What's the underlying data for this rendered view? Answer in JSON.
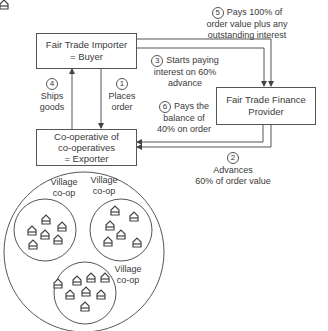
{
  "diagram": {
    "nodes": {
      "importer": {
        "line1": "Fair Trade Importer",
        "line2": "= Buyer"
      },
      "finance": {
        "line1": "Fair Trade Finance",
        "line2": "Provider"
      },
      "coop": {
        "line1": "Co-operative of",
        "line2": "co-operatives",
        "line3": "= Exporter"
      }
    },
    "steps": [
      {
        "num": "1",
        "line1": "Places",
        "line2": "order"
      },
      {
        "num": "2",
        "line1": "Advances",
        "line2": "60% of order value"
      },
      {
        "num": "3",
        "line1": "Starts paying",
        "line2": "interest on 60%",
        "line3": "advance"
      },
      {
        "num": "4",
        "line1": "Ships",
        "line2": "goods"
      },
      {
        "num": "5",
        "line1": "Pays 100% of",
        "line2": "order value plus any",
        "line3": "outstanding interest"
      },
      {
        "num": "6",
        "line1": "Pays the",
        "line2": "balance of",
        "line3": "40% on order"
      }
    ],
    "villages": [
      {
        "line1": "Village",
        "line2": "co-op"
      },
      {
        "line1": "Village",
        "line2": "co-op"
      },
      {
        "line1": "Village",
        "line2": "co-op"
      }
    ],
    "colors": {
      "line": "#555555",
      "text": "#3a3a3a"
    }
  }
}
